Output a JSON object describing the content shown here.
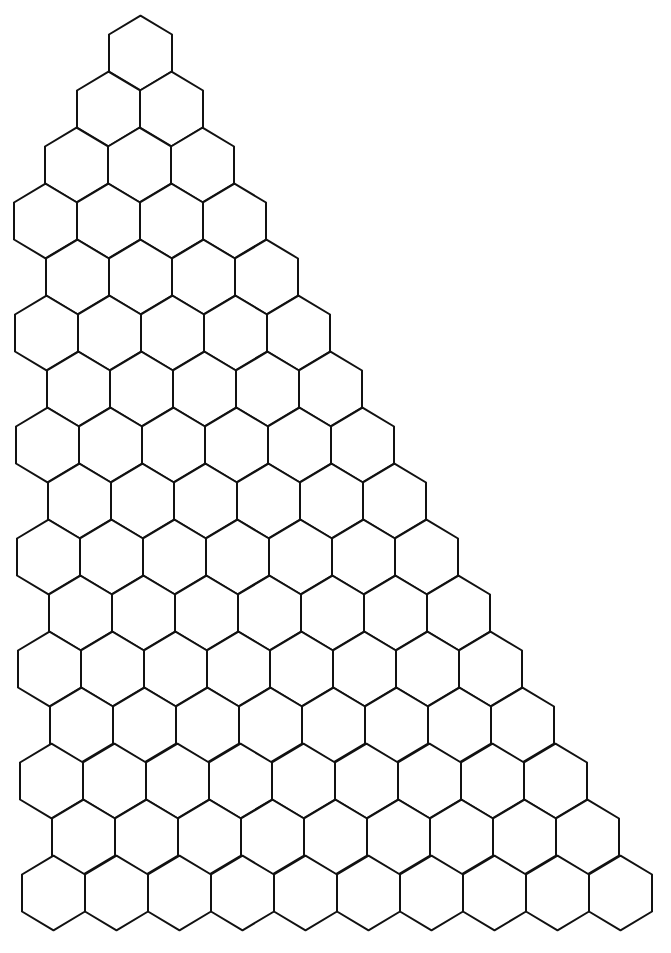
{
  "diagram": {
    "type": "hexagonal-grid-triangle",
    "stroke_color": "#111111",
    "fill_color": "#ffffff",
    "background": "#ffffff",
    "hex_width": 63,
    "hex_side": 37,
    "row_step_y": 56.0,
    "first_row_center_y": 53,
    "rows": [
      {
        "left": 109,
        "count": 1
      },
      {
        "left": 77,
        "count": 2
      },
      {
        "left": 45,
        "count": 3
      },
      {
        "left": 14,
        "count": 4
      },
      {
        "left": 46,
        "count": 4
      },
      {
        "left": 15,
        "count": 5
      },
      {
        "left": 47,
        "count": 5
      },
      {
        "left": 16,
        "count": 6
      },
      {
        "left": 48,
        "count": 6
      },
      {
        "left": 17,
        "count": 7
      },
      {
        "left": 49,
        "count": 7
      },
      {
        "left": 18,
        "count": 8
      },
      {
        "left": 50,
        "count": 8
      },
      {
        "left": 20,
        "count": 9
      },
      {
        "left": 52,
        "count": 9
      },
      {
        "left": 22,
        "count": 10
      }
    ],
    "total_hexagons": 94
  }
}
